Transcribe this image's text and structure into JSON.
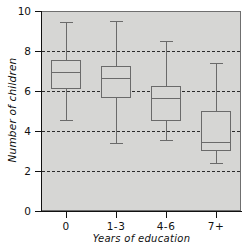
{
  "chart_data": {
    "type": "box",
    "title": "",
    "xlabel": "Years of education",
    "ylabel": "Number of children",
    "categories": [
      "0",
      "1-3",
      "4-6",
      "7+"
    ],
    "ylim": [
      0,
      10
    ],
    "yticks": [
      0,
      2,
      4,
      6,
      8,
      10
    ],
    "ytick_labels": [
      "0",
      "2",
      "4",
      "6",
      "8",
      "10"
    ],
    "gridlines": {
      "visible": true,
      "axis": "y",
      "values": [
        2,
        4,
        6,
        8
      ],
      "style": "dashed",
      "color": "#2b2b2b"
    },
    "legend": null,
    "plot_background": "#d6d6d4",
    "box_edge_color": "#6a6a6a",
    "box_fill_color": "#d6d6d4",
    "boxes": [
      {
        "category": "0",
        "whisker_low": 4.55,
        "q1": 6.1,
        "median": 6.95,
        "q3": 7.55,
        "whisker_high": 9.45
      },
      {
        "category": "1-3",
        "whisker_low": 3.4,
        "q1": 5.65,
        "median": 6.65,
        "q3": 7.25,
        "whisker_high": 9.5
      },
      {
        "category": "4-6",
        "whisker_low": 3.55,
        "q1": 4.5,
        "median": 5.65,
        "q3": 6.25,
        "whisker_high": 8.5
      },
      {
        "category": "7+",
        "whisker_low": 2.4,
        "q1": 3.0,
        "median": 3.45,
        "q3": 5.0,
        "whisker_high": 7.4
      }
    ]
  }
}
